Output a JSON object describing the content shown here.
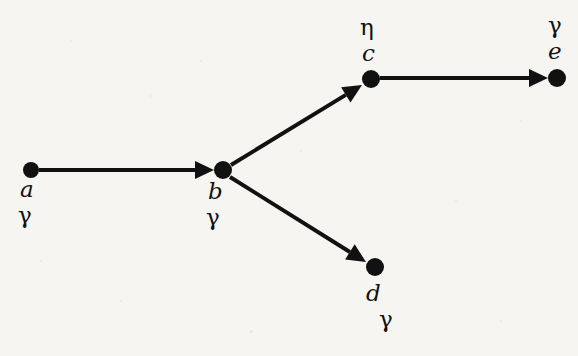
{
  "diagram": {
    "background_color": "#f6f5f2",
    "ink_color": "#111111",
    "nodes": [
      {
        "id": "a",
        "name_label": "a",
        "type_label": "γ",
        "x": 31,
        "y": 170,
        "radius": 8,
        "name_x": 20,
        "name_y": 178,
        "type_x": 18,
        "type_y": 204
      },
      {
        "id": "b",
        "name_label": "b",
        "type_label": "γ",
        "x": 223,
        "y": 170,
        "radius": 9,
        "name_x": 208,
        "name_y": 180,
        "type_x": 206,
        "type_y": 206
      },
      {
        "id": "c",
        "name_label": "c",
        "type_label": "η",
        "x": 371,
        "y": 79,
        "radius": 9,
        "name_x": 362,
        "name_y": 42,
        "type_x": 360,
        "type_y": 16
      },
      {
        "id": "d",
        "name_label": "d",
        "type_label": "γ",
        "x": 375,
        "y": 267,
        "radius": 9,
        "name_x": 366,
        "name_y": 282,
        "type_x": 379,
        "type_y": 308
      },
      {
        "id": "e",
        "name_label": "e",
        "type_label": "γ",
        "x": 557,
        "y": 78,
        "radius": 9,
        "name_x": 548,
        "name_y": 40,
        "type_x": 548,
        "type_y": 14
      }
    ],
    "edges": [
      {
        "id": "a-b",
        "from": "a",
        "to": "b",
        "x1": 39,
        "y1": 170,
        "x2": 214,
        "y2": 170,
        "directed": true
      },
      {
        "id": "b-c",
        "from": "b",
        "to": "c",
        "x1": 231,
        "y1": 165,
        "x2": 362,
        "y2": 85,
        "directed": true
      },
      {
        "id": "b-d",
        "from": "b",
        "to": "d",
        "x1": 230,
        "y1": 177,
        "x2": 366,
        "y2": 262,
        "directed": true
      },
      {
        "id": "c-e",
        "from": "c",
        "to": "e",
        "x1": 380,
        "y1": 78,
        "x2": 548,
        "y2": 78,
        "directed": true
      }
    ],
    "stroke_width": 4,
    "arrow_length": 19,
    "arrow_half_width": 9
  }
}
